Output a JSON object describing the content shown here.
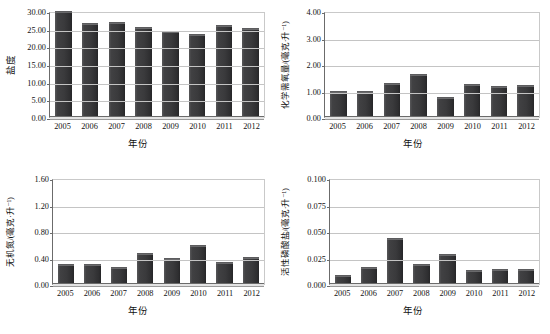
{
  "figure": {
    "xlabel": "年份",
    "years": [
      "2005",
      "2006",
      "2007",
      "2008",
      "2009",
      "2010",
      "2011",
      "2012"
    ]
  },
  "chart_data": [
    {
      "id": "salinity",
      "type": "bar",
      "title": "",
      "xlabel": "年份",
      "ylabel": "盐度",
      "categories": [
        "2005",
        "2006",
        "2007",
        "2008",
        "2009",
        "2010",
        "2011",
        "2012"
      ],
      "values": [
        29.8,
        26.2,
        26.5,
        25.1,
        24.0,
        23.2,
        25.7,
        24.8
      ],
      "ylim": [
        0.0,
        30.0
      ],
      "yticks": [
        0.0,
        5.0,
        10.0,
        15.0,
        20.0,
        25.0,
        30.0
      ],
      "ytick_labels": [
        "0.00",
        "5.00",
        "10.00",
        "15.00",
        "20.00",
        "25.00",
        "30.00"
      ],
      "grid": true,
      "legend": "none",
      "bar_color": "#3a3a3c"
    },
    {
      "id": "cod",
      "type": "bar",
      "title": "",
      "xlabel": "年份",
      "ylabel": "化学需氧量/(毫克·升⁻¹)",
      "categories": [
        "2005",
        "2006",
        "2007",
        "2008",
        "2009",
        "2010",
        "2011",
        "2012"
      ],
      "values": [
        0.95,
        0.93,
        1.23,
        1.6,
        0.7,
        1.2,
        1.15,
        1.16
      ],
      "ylim": [
        0.0,
        4.0
      ],
      "yticks": [
        0.0,
        1.0,
        2.0,
        3.0,
        4.0
      ],
      "ytick_labels": [
        "0.00",
        "1.00",
        "2.00",
        "3.00",
        "4.00"
      ],
      "grid": true,
      "legend": "none",
      "bar_color": "#3a3a3c"
    },
    {
      "id": "inorganic-nitrogen",
      "type": "bar",
      "title": "",
      "xlabel": "年份",
      "ylabel": "无机氮/(毫克·升⁻¹)",
      "categories": [
        "2005",
        "2006",
        "2007",
        "2008",
        "2009",
        "2010",
        "2011",
        "2012"
      ],
      "values": [
        0.29,
        0.29,
        0.24,
        0.45,
        0.38,
        0.57,
        0.32,
        0.4
      ],
      "ylim": [
        0.0,
        1.6
      ],
      "yticks": [
        0.0,
        0.4,
        0.8,
        1.2,
        1.6
      ],
      "ytick_labels": [
        "0.00",
        "0.40",
        "0.80",
        "1.20",
        "1.60"
      ],
      "grid": true,
      "legend": "none",
      "bar_color": "#3a3a3c"
    },
    {
      "id": "active-phosphate",
      "type": "bar",
      "title": "",
      "xlabel": "年份",
      "ylabel": "活性磷酸盐/(毫克·升⁻¹)",
      "categories": [
        "2005",
        "2006",
        "2007",
        "2008",
        "2009",
        "2010",
        "2011",
        "2012"
      ],
      "values": [
        0.008,
        0.015,
        0.042,
        0.018,
        0.027,
        0.012,
        0.013,
        0.013
      ],
      "ylim": [
        0.0,
        0.1
      ],
      "yticks": [
        0.0,
        0.025,
        0.05,
        0.075,
        0.1
      ],
      "ytick_labels": [
        "0.000",
        "0.025",
        "0.050",
        "0.075",
        "0.100"
      ],
      "grid": true,
      "legend": "none",
      "bar_color": "#3a3a3c"
    }
  ]
}
